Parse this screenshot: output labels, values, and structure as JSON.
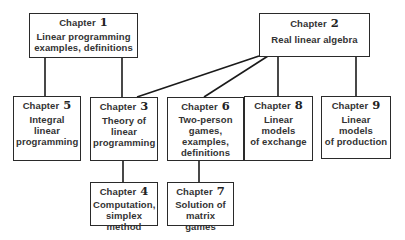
{
  "diagram": {
    "type": "chapter-dependency-chart",
    "nodes": [
      {
        "id": "ch1",
        "chapter_label": "Chapter",
        "number": "1",
        "title": "Linear programming\nexamples, definitions"
      },
      {
        "id": "ch2",
        "chapter_label": "Chapter",
        "number": "2",
        "title": "Real linear algebra"
      },
      {
        "id": "ch3",
        "chapter_label": "Chapter",
        "number": "3",
        "title": "Theory of\nlinear\nprogramming"
      },
      {
        "id": "ch4",
        "chapter_label": "Chapter",
        "number": "4",
        "title": "Computation,\nsimplex method"
      },
      {
        "id": "ch5",
        "chapter_label": "Chapter",
        "number": "5",
        "title": "Integral linear\nprogramming"
      },
      {
        "id": "ch6",
        "chapter_label": "Chapter",
        "number": "6",
        "title": "Two-person\ngames,\nexamples,\ndefinitions"
      },
      {
        "id": "ch7",
        "chapter_label": "Chapter",
        "number": "7",
        "title": "Solution of\nmatrix games"
      },
      {
        "id": "ch8",
        "chapter_label": "Chapter",
        "number": "8",
        "title": "Linear models\nof exchange"
      },
      {
        "id": "ch9",
        "chapter_label": "Chapter",
        "number": "9",
        "title": "Linear models\nof production"
      }
    ],
    "edges": [
      {
        "from": "ch1",
        "to": "ch5"
      },
      {
        "from": "ch1",
        "to": "ch3"
      },
      {
        "from": "ch2",
        "to": "ch3"
      },
      {
        "from": "ch2",
        "to": "ch6"
      },
      {
        "from": "ch2",
        "to": "ch8"
      },
      {
        "from": "ch2",
        "to": "ch9"
      },
      {
        "from": "ch3",
        "to": "ch4"
      },
      {
        "from": "ch6",
        "to": "ch7"
      }
    ]
  }
}
